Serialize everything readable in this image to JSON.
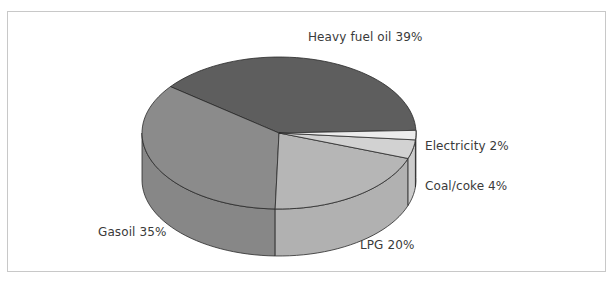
{
  "chart_data": {
    "type": "pie",
    "style": "3d",
    "title": "",
    "categories": [
      "Heavy fuel oil",
      "Electricity",
      "Coal/coke",
      "LPG",
      "Gasoil"
    ],
    "values": [
      39,
      2,
      4,
      20,
      35
    ],
    "unit": "%",
    "colors": [
      "#5e5e5e",
      "#ececec",
      "#d2d2d2",
      "#b6b6b6",
      "#8b8b8b"
    ],
    "labels": [
      {
        "text": "Heavy fuel oil 39%",
        "category": "Heavy fuel oil"
      },
      {
        "text": "Electricity 2%",
        "category": "Electricity"
      },
      {
        "text": "Coal/coke 4%",
        "category": "Coal/coke"
      },
      {
        "text": "LPG 20%",
        "category": "LPG"
      },
      {
        "text": "Gasoil 35%",
        "category": "Gasoil"
      }
    ],
    "legend": "none (direct slice labels)",
    "grid": false
  }
}
